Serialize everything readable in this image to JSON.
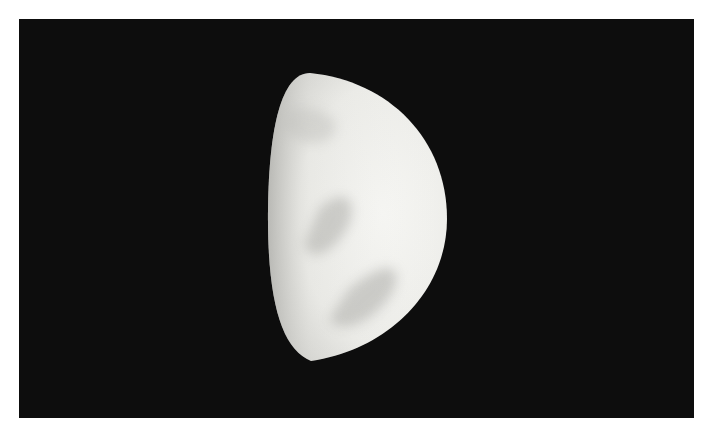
{
  "image": {
    "subject": "Venus at half phase (dichotomy) — drawing/photo of cloud markings",
    "background_color": "#0d0d0d",
    "border_color": "#ffffff",
    "planet_color": "#eeeeea",
    "shading_color": "#b8b8b4"
  }
}
